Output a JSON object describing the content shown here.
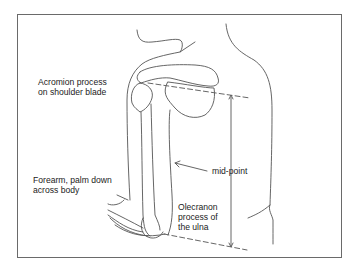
{
  "figure": {
    "colors": {
      "stroke": "#555555",
      "text": "#222222",
      "frame": "#6a6a6a"
    }
  },
  "labels": {
    "acromion": {
      "line1": "Acromion process",
      "line2": "on shoulder blade"
    },
    "forearm": {
      "line1": "Forearm, palm down",
      "line2": "across body"
    },
    "midpoint": {
      "text": "mid-point"
    },
    "olecranon": {
      "line1": "Olecranon",
      "line2": "process of",
      "line3": "the ulna"
    }
  }
}
